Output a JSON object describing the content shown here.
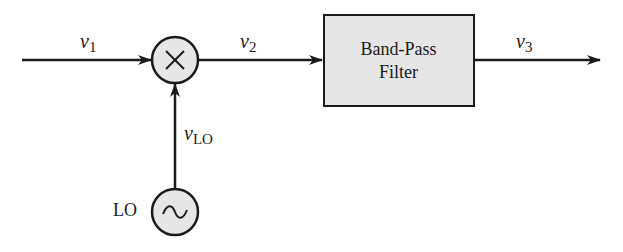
{
  "diagram": {
    "type": "block-diagram",
    "signals": {
      "v1": {
        "base": "v",
        "sub": "1"
      },
      "v2": {
        "base": "v",
        "sub": "2"
      },
      "v3": {
        "base": "v",
        "sub": "3"
      },
      "vlo": {
        "base": "v",
        "sub": "LO"
      }
    },
    "mixer": {
      "symbol": "×",
      "icon": "multiply-icon"
    },
    "filter": {
      "line1": "Band-Pass",
      "line2": "Filter"
    },
    "oscillator": {
      "label": "LO",
      "symbol": "~",
      "icon": "sine-wave-icon"
    },
    "colors": {
      "block_fill": "#e6e6e6",
      "stroke": "#1a1a1a"
    }
  }
}
